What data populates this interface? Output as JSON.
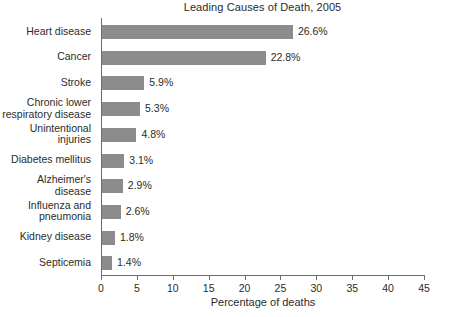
{
  "chart_data": {
    "type": "bar",
    "orientation": "horizontal",
    "title": "Leading Causes of Death, 2005",
    "xlabel": "Percentage of deaths",
    "ylabel": "",
    "xlim": [
      0,
      45
    ],
    "xticks": [
      0,
      5,
      10,
      15,
      20,
      25,
      30,
      35,
      40,
      45
    ],
    "xticklabels": [
      "0",
      "5",
      "10",
      "15",
      "20",
      "25",
      "30",
      "35",
      "40",
      "45"
    ],
    "grid": false,
    "legend": null,
    "bar_color": "#8c8c8c",
    "categories": [
      "Heart disease",
      "Cancer",
      "Stroke",
      "Chronic lower\nrespiratory disease",
      "Unintentional\ninjuries",
      "Diabetes mellitus",
      "Alzheimer's\ndisease",
      "Influenza and\npneumonia",
      "Kidney disease",
      "Septicemia"
    ],
    "values": [
      26.6,
      22.8,
      5.9,
      5.3,
      4.8,
      3.1,
      2.9,
      2.6,
      1.8,
      1.4
    ],
    "value_labels": [
      "26.6%",
      "22.8%",
      "5.9%",
      "5.3%",
      "4.8%",
      "3.1%",
      "2.9%",
      "2.6%",
      "1.8%",
      "1.4%"
    ]
  }
}
